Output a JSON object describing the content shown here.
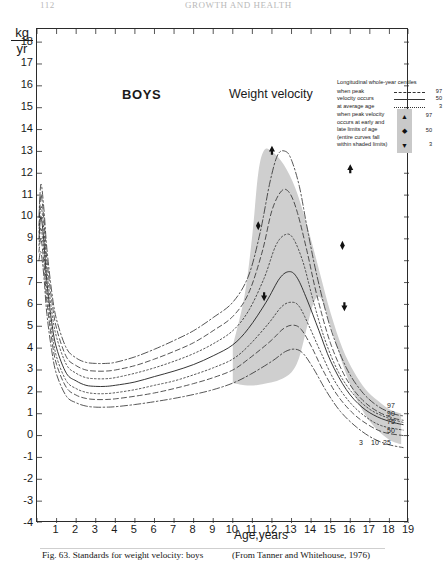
{
  "runhead": {
    "left": "112",
    "right": "GROWTH AND HEALTH"
  },
  "axes": {
    "unit_numerator": "kg",
    "unit_denominator": "yr",
    "y_label": "",
    "x_label": "Age,years",
    "y_ticks": [
      18,
      17,
      16,
      15,
      14,
      13,
      12,
      11,
      10,
      9,
      8,
      7,
      6,
      5,
      4,
      3,
      2,
      1,
      0,
      -1,
      -2,
      -3,
      -4
    ],
    "y_tick_labels": [
      "18",
      "17",
      "16",
      "15",
      "14",
      "13",
      "12",
      "11",
      "10",
      "9",
      "8",
      "7",
      "6",
      "5",
      "4",
      "3",
      "2",
      "1",
      "0",
      "-1",
      "-2",
      "-3",
      "-4"
    ],
    "ylim": [
      -4,
      18.6
    ],
    "x_ticks": [
      0,
      1,
      2,
      3,
      4,
      5,
      6,
      7,
      8,
      9,
      10,
      11,
      12,
      13,
      14,
      15,
      16,
      17,
      18,
      19
    ],
    "x_tick_labels": [
      "",
      "1",
      "2",
      "3",
      "4",
      "5",
      "6",
      "7",
      "8",
      "9",
      "10",
      "11",
      "12",
      "13",
      "14",
      "15",
      "16",
      "17",
      "18",
      "19"
    ],
    "xlim": [
      0,
      19
    ]
  },
  "titles": {
    "group": "BOYS",
    "measure": "Weight velocity"
  },
  "legend": {
    "title": "Longitudinal whole-year centiles",
    "block1": {
      "lines": [
        "when peak",
        "velocity occurs",
        "at average age"
      ],
      "values": [
        "97",
        "50",
        "3"
      ]
    },
    "block2": {
      "lines": [
        "when peak velocity",
        "occurs at early and",
        "late limits of age",
        "(entire curves fall",
        "within shaded limits)"
      ],
      "values": [
        "97",
        "50",
        "3"
      ],
      "markers": [
        "up-arrow",
        "diamond",
        "down-arrow"
      ]
    }
  },
  "curve_labels": {
    "upper": [
      "97",
      "90",
      "75",
      "50"
    ],
    "lower": [
      "3",
      "10",
      "25"
    ]
  },
  "caption": {
    "left": "Fig. 63. Standards for weight velocity: boys",
    "right": "(From Tanner and Whitehouse, 1976)"
  },
  "colors": {
    "shade": "#cfcfcf",
    "ink": "#2b2b2b",
    "paper": "#ffffff"
  },
  "chart_data": {
    "type": "line",
    "title": "Weight velocity",
    "subtitle": "BOYS",
    "xlabel": "Age,years",
    "ylabel": "kg/yr",
    "xlim": [
      0,
      19
    ],
    "ylim": [
      -4,
      18.6
    ],
    "grid": false,
    "legend_position": "top-right",
    "shaded_band_label": "entire curves fall within shaded limits",
    "shaded_band_x_range": [
      10.0,
      18.6
    ],
    "shaded_band_upper": [
      [
        10.0,
        4.1
      ],
      [
        10.6,
        6.4
      ],
      [
        11.0,
        9.2
      ],
      [
        11.3,
        12.0
      ],
      [
        11.6,
        13.05
      ],
      [
        12.0,
        13.0
      ],
      [
        12.6,
        12.4
      ],
      [
        13.2,
        11.3
      ],
      [
        13.8,
        9.6
      ],
      [
        14.4,
        7.6
      ],
      [
        15.0,
        5.6
      ],
      [
        15.6,
        4.0
      ],
      [
        16.2,
        2.9
      ],
      [
        16.8,
        2.1
      ],
      [
        17.4,
        1.6
      ],
      [
        18.0,
        1.2
      ],
      [
        18.6,
        1.0
      ]
    ],
    "shaded_band_lower": [
      [
        10.0,
        2.4
      ],
      [
        10.6,
        2.3
      ],
      [
        11.2,
        2.3
      ],
      [
        11.8,
        2.4
      ],
      [
        12.4,
        2.55
      ],
      [
        13.0,
        2.9
      ],
      [
        13.4,
        3.6
      ],
      [
        13.8,
        5.0
      ],
      [
        14.1,
        6.0
      ],
      [
        14.35,
        6.35
      ],
      [
        14.6,
        6.1
      ],
      [
        15.0,
        5.0
      ],
      [
        15.6,
        3.3
      ],
      [
        16.2,
        1.9
      ],
      [
        16.8,
        0.9
      ],
      [
        17.4,
        0.25
      ],
      [
        18.0,
        -0.2
      ],
      [
        18.6,
        -0.4
      ]
    ],
    "series": [
      {
        "name": "97",
        "style": "dash-dot",
        "points": [
          [
            0.1,
            10.0
          ],
          [
            0.2,
            11.5
          ],
          [
            0.35,
            10.4
          ],
          [
            0.5,
            8.6
          ],
          [
            0.75,
            6.6
          ],
          [
            1.0,
            5.3
          ],
          [
            1.5,
            4.0
          ],
          [
            2.0,
            3.55
          ],
          [
            2.5,
            3.35
          ],
          [
            3.0,
            3.3
          ],
          [
            3.5,
            3.3
          ],
          [
            4.0,
            3.35
          ],
          [
            5.0,
            3.6
          ],
          [
            6.0,
            3.95
          ],
          [
            7.0,
            4.35
          ],
          [
            8.0,
            4.8
          ],
          [
            9.0,
            5.4
          ],
          [
            10.0,
            6.1
          ],
          [
            10.8,
            7.3
          ],
          [
            11.4,
            9.3
          ],
          [
            11.9,
            11.6
          ],
          [
            12.3,
            12.85
          ],
          [
            12.7,
            13.0
          ],
          [
            13.0,
            12.6
          ],
          [
            13.4,
            11.4
          ],
          [
            13.8,
            9.5
          ],
          [
            14.3,
            7.3
          ],
          [
            15.0,
            4.9
          ],
          [
            15.8,
            3.1
          ],
          [
            16.6,
            2.0
          ],
          [
            17.4,
            1.35
          ],
          [
            18.2,
            1.0
          ],
          [
            18.7,
            0.9
          ]
        ]
      },
      {
        "name": "90",
        "style": "dashed",
        "points": [
          [
            0.1,
            9.6
          ],
          [
            0.2,
            11.0
          ],
          [
            0.35,
            9.9
          ],
          [
            0.5,
            8.1
          ],
          [
            0.75,
            6.2
          ],
          [
            1.0,
            4.9
          ],
          [
            1.5,
            3.6
          ],
          [
            2.0,
            3.2
          ],
          [
            2.5,
            3.0
          ],
          [
            3.0,
            2.95
          ],
          [
            3.5,
            2.95
          ],
          [
            4.0,
            3.0
          ],
          [
            5.0,
            3.2
          ],
          [
            6.0,
            3.5
          ],
          [
            7.0,
            3.85
          ],
          [
            8.0,
            4.25
          ],
          [
            9.0,
            4.8
          ],
          [
            10.0,
            5.45
          ],
          [
            10.8,
            6.5
          ],
          [
            11.5,
            8.4
          ],
          [
            12.0,
            10.3
          ],
          [
            12.5,
            11.2
          ],
          [
            12.9,
            11.1
          ],
          [
            13.3,
            10.2
          ],
          [
            13.8,
            8.4
          ],
          [
            14.3,
            6.4
          ],
          [
            15.0,
            4.2
          ],
          [
            15.8,
            2.6
          ],
          [
            16.6,
            1.65
          ],
          [
            17.4,
            1.1
          ],
          [
            18.2,
            0.8
          ],
          [
            18.7,
            0.7
          ]
        ]
      },
      {
        "name": "75",
        "style": "dotted",
        "points": [
          [
            0.1,
            9.3
          ],
          [
            0.2,
            10.5
          ],
          [
            0.35,
            9.4
          ],
          [
            0.5,
            7.6
          ],
          [
            0.75,
            5.7
          ],
          [
            1.0,
            4.5
          ],
          [
            1.5,
            3.25
          ],
          [
            2.0,
            2.85
          ],
          [
            2.5,
            2.65
          ],
          [
            3.0,
            2.6
          ],
          [
            3.5,
            2.6
          ],
          [
            4.0,
            2.65
          ],
          [
            5.0,
            2.85
          ],
          [
            6.0,
            3.1
          ],
          [
            7.0,
            3.4
          ],
          [
            8.0,
            3.75
          ],
          [
            9.0,
            4.2
          ],
          [
            10.0,
            4.8
          ],
          [
            10.8,
            5.7
          ],
          [
            11.6,
            7.2
          ],
          [
            12.2,
            8.7
          ],
          [
            12.7,
            9.2
          ],
          [
            13.1,
            9.0
          ],
          [
            13.6,
            7.9
          ],
          [
            14.1,
            6.2
          ],
          [
            14.7,
            4.4
          ],
          [
            15.4,
            2.9
          ],
          [
            16.2,
            1.85
          ],
          [
            17.0,
            1.2
          ],
          [
            17.8,
            0.85
          ],
          [
            18.7,
            0.6
          ]
        ]
      },
      {
        "name": "50",
        "style": "solid",
        "points": [
          [
            0.1,
            9.0
          ],
          [
            0.2,
            10.0
          ],
          [
            0.35,
            8.9
          ],
          [
            0.5,
            7.1
          ],
          [
            0.75,
            5.2
          ],
          [
            1.0,
            4.0
          ],
          [
            1.5,
            2.85
          ],
          [
            2.0,
            2.5
          ],
          [
            2.5,
            2.3
          ],
          [
            3.0,
            2.25
          ],
          [
            3.5,
            2.25
          ],
          [
            4.0,
            2.3
          ],
          [
            5.0,
            2.45
          ],
          [
            6.0,
            2.7
          ],
          [
            7.0,
            2.95
          ],
          [
            8.0,
            3.25
          ],
          [
            9.0,
            3.65
          ],
          [
            10.0,
            4.15
          ],
          [
            10.8,
            4.9
          ],
          [
            11.7,
            6.1
          ],
          [
            12.4,
            7.2
          ],
          [
            12.9,
            7.5
          ],
          [
            13.3,
            7.2
          ],
          [
            13.8,
            6.2
          ],
          [
            14.4,
            4.8
          ],
          [
            15.0,
            3.4
          ],
          [
            15.8,
            2.1
          ],
          [
            16.6,
            1.3
          ],
          [
            17.4,
            0.85
          ],
          [
            18.2,
            0.6
          ],
          [
            18.7,
            0.5
          ]
        ]
      },
      {
        "name": "25",
        "style": "dotted",
        "points": [
          [
            0.1,
            8.7
          ],
          [
            0.2,
            9.5
          ],
          [
            0.35,
            8.4
          ],
          [
            0.5,
            6.7
          ],
          [
            0.75,
            4.8
          ],
          [
            1.0,
            3.6
          ],
          [
            1.5,
            2.5
          ],
          [
            2.0,
            2.15
          ],
          [
            2.5,
            1.98
          ],
          [
            3.0,
            1.92
          ],
          [
            3.5,
            1.92
          ],
          [
            4.0,
            1.96
          ],
          [
            5.0,
            2.1
          ],
          [
            6.0,
            2.3
          ],
          [
            7.0,
            2.5
          ],
          [
            8.0,
            2.78
          ],
          [
            9.0,
            3.1
          ],
          [
            10.0,
            3.5
          ],
          [
            10.8,
            4.1
          ],
          [
            11.8,
            5.1
          ],
          [
            12.5,
            5.9
          ],
          [
            13.0,
            6.1
          ],
          [
            13.4,
            5.9
          ],
          [
            13.9,
            5.0
          ],
          [
            14.5,
            3.8
          ],
          [
            15.2,
            2.5
          ],
          [
            16.0,
            1.5
          ],
          [
            16.8,
            0.85
          ],
          [
            17.6,
            0.45
          ],
          [
            18.7,
            0.25
          ]
        ]
      },
      {
        "name": "10",
        "style": "dashed",
        "points": [
          [
            0.1,
            8.4
          ],
          [
            0.2,
            9.0
          ],
          [
            0.35,
            7.9
          ],
          [
            0.5,
            6.2
          ],
          [
            0.75,
            4.4
          ],
          [
            1.0,
            3.25
          ],
          [
            1.5,
            2.2
          ],
          [
            2.0,
            1.85
          ],
          [
            2.5,
            1.7
          ],
          [
            3.0,
            1.65
          ],
          [
            3.5,
            1.65
          ],
          [
            4.0,
            1.68
          ],
          [
            5.0,
            1.8
          ],
          [
            6.0,
            1.95
          ],
          [
            7.0,
            2.15
          ],
          [
            8.0,
            2.38
          ],
          [
            9.0,
            2.65
          ],
          [
            10.0,
            3.0
          ],
          [
            10.8,
            3.5
          ],
          [
            11.9,
            4.3
          ],
          [
            12.6,
            4.9
          ],
          [
            13.1,
            5.05
          ],
          [
            13.5,
            4.85
          ],
          [
            14.0,
            4.1
          ],
          [
            14.6,
            3.0
          ],
          [
            15.3,
            1.9
          ],
          [
            16.1,
            1.05
          ],
          [
            16.9,
            0.5
          ],
          [
            17.7,
            0.15
          ],
          [
            18.7,
            0.0
          ]
        ]
      },
      {
        "name": "3",
        "style": "dash-dot",
        "points": [
          [
            0.1,
            8.0
          ],
          [
            0.2,
            8.4
          ],
          [
            0.35,
            7.3
          ],
          [
            0.5,
            5.6
          ],
          [
            0.75,
            3.9
          ],
          [
            1.0,
            2.8
          ],
          [
            1.5,
            1.8
          ],
          [
            2.0,
            1.5
          ],
          [
            2.5,
            1.35
          ],
          [
            3.0,
            1.3
          ],
          [
            3.5,
            1.3
          ],
          [
            4.0,
            1.32
          ],
          [
            5.0,
            1.42
          ],
          [
            6.0,
            1.55
          ],
          [
            7.0,
            1.7
          ],
          [
            8.0,
            1.88
          ],
          [
            9.0,
            2.1
          ],
          [
            10.0,
            2.4
          ],
          [
            10.9,
            2.8
          ],
          [
            12.0,
            3.4
          ],
          [
            12.7,
            3.85
          ],
          [
            13.2,
            3.95
          ],
          [
            13.6,
            3.75
          ],
          [
            14.1,
            3.1
          ],
          [
            14.8,
            2.0
          ],
          [
            15.5,
            1.1
          ],
          [
            16.3,
            0.4
          ],
          [
            17.1,
            -0.1
          ],
          [
            17.9,
            -0.4
          ],
          [
            18.7,
            -0.55
          ]
        ]
      }
    ],
    "annotations": [
      {
        "marker": "up-arrow",
        "x": 12.0,
        "y": 13.05,
        "meaning": "97 - peak at early/late limits"
      },
      {
        "marker": "up-arrow",
        "x": 16.0,
        "y": 12.2,
        "meaning": "97 - peak at early/late limits"
      },
      {
        "marker": "diamond",
        "x": 11.3,
        "y": 9.6,
        "meaning": "50 - peak at early/late limits"
      },
      {
        "marker": "diamond",
        "x": 15.6,
        "y": 8.7,
        "meaning": "50 - peak at early/late limits"
      },
      {
        "marker": "down-arrow",
        "x": 11.6,
        "y": 6.35,
        "meaning": "3 - peak at early/late limits"
      },
      {
        "marker": "down-arrow",
        "x": 15.7,
        "y": 5.9,
        "meaning": "3 - peak at early/late limits"
      }
    ]
  }
}
